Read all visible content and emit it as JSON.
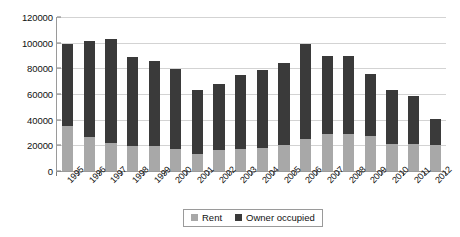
{
  "chart_data": {
    "type": "bar",
    "subtype": "stacked-column",
    "title": "",
    "xlabel": "",
    "ylabel": "",
    "ylim": [
      0,
      120000
    ],
    "ytick_step": 20000,
    "yticks": [
      120000,
      100000,
      80000,
      60000,
      40000,
      20000,
      0
    ],
    "ytick_labels": [
      "120000",
      "100000",
      "80000",
      "60000",
      "40000",
      "20000",
      "0"
    ],
    "grid": true,
    "legend_position": "bottom",
    "categories": [
      "1995",
      "1996",
      "1997",
      "1998",
      "1999",
      "2000",
      "2001",
      "2002",
      "2003",
      "2004",
      "2005",
      "2006",
      "2007",
      "2008",
      "2009",
      "2010",
      "2011",
      "2012"
    ],
    "series": [
      {
        "name": "Rent",
        "color": "#a8a8a8",
        "values": [
          35000,
          26000,
          22000,
          19000,
          19000,
          17000,
          13000,
          16000,
          17000,
          18000,
          20000,
          25000,
          29000,
          29000,
          27000,
          21000,
          21000,
          20000
        ]
      },
      {
        "name": "Owner occupied",
        "color": "#3a3a3a",
        "values": [
          63000,
          75000,
          80000,
          69000,
          66000,
          62000,
          50000,
          51000,
          57000,
          60000,
          64000,
          73000,
          60000,
          60000,
          48000,
          42000,
          37000,
          20000
        ]
      }
    ],
    "totals": [
      98000,
      101000,
      102000,
      88000,
      85000,
      79000,
      63000,
      67000,
      74000,
      78000,
      84000,
      98000,
      89000,
      89000,
      75000,
      63000,
      58000,
      40000
    ]
  },
  "legend": {
    "items": [
      {
        "label": "Rent",
        "swatch": "legend-swatch-rent"
      },
      {
        "label": "Owner occupied",
        "swatch": "legend-swatch-owner"
      }
    ]
  },
  "colors": {
    "rent": "#a8a8a8",
    "owner_occupied": "#3a3a3a",
    "gridline": "#d3d3d3",
    "axis": "#9a9a9a",
    "background": "#ffffff"
  }
}
